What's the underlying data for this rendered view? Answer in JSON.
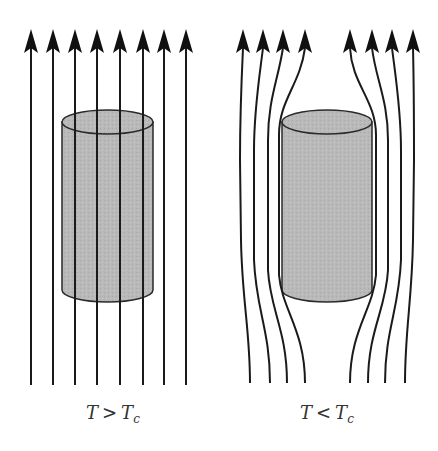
{
  "panels": [
    {
      "id": "normal-state",
      "label": {
        "var": "T",
        "op": ">",
        "var2": "T",
        "sub": "c"
      },
      "description": "Magnetic field lines pass straight through the cylinder"
    },
    {
      "id": "superconducting-state",
      "label": {
        "var": "T",
        "op": "<",
        "var2": "T",
        "sub": "c"
      },
      "description": "Magnetic field lines are expelled around the cylinder (Meissner effect)"
    }
  ],
  "colors": {
    "line": "#1a1a1a",
    "cylinder_fill": "#b8b8b8",
    "cylinder_stroke": "#2a2a2a",
    "background": "#ffffff"
  }
}
